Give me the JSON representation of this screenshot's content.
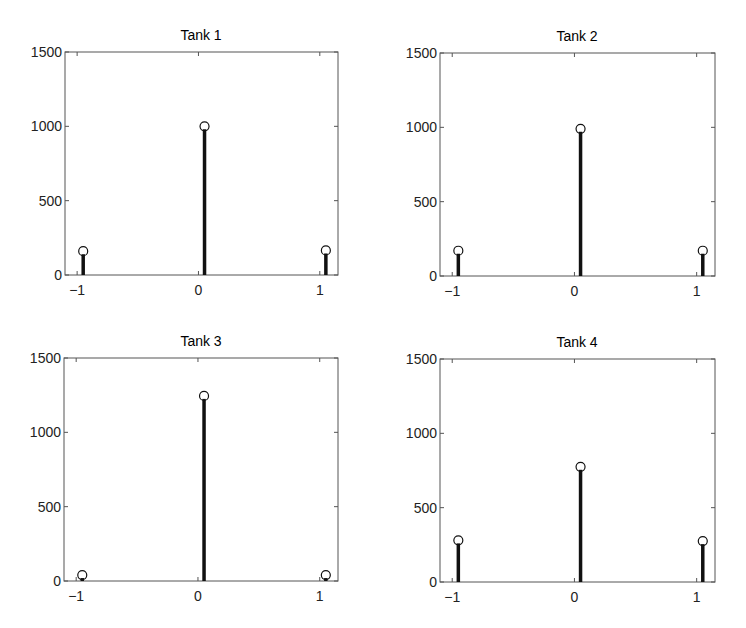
{
  "chart_data": [
    {
      "type": "stem",
      "title": "Tank 1",
      "x": [
        -0.95,
        0.05,
        1.05
      ],
      "values": [
        160,
        1000,
        165
      ],
      "xlim": [
        -1.1,
        1.15
      ],
      "ylim": [
        0,
        1500
      ],
      "xticks": [
        -1,
        0,
        1
      ],
      "xtick_labels": [
        "−1",
        "0",
        "1"
      ],
      "yticks": [
        0,
        500,
        1000,
        1500
      ],
      "ytick_labels": [
        "0",
        "500",
        "1000",
        "1500"
      ],
      "xlabel": "",
      "ylabel": "",
      "grid": false,
      "marker": "open-circle"
    },
    {
      "type": "stem",
      "title": "Tank 2",
      "x": [
        -0.95,
        0.05,
        1.05
      ],
      "values": [
        170,
        990,
        170
      ],
      "xlim": [
        -1.1,
        1.15
      ],
      "ylim": [
        0,
        1500
      ],
      "xticks": [
        -1,
        0,
        1
      ],
      "xtick_labels": [
        "−1",
        "0",
        "1"
      ],
      "yticks": [
        0,
        500,
        1000,
        1500
      ],
      "ytick_labels": [
        "0",
        "500",
        "1000",
        "1500"
      ],
      "xlabel": "",
      "ylabel": "",
      "grid": false,
      "marker": "open-circle"
    },
    {
      "type": "stem",
      "title": "Tank 3",
      "x": [
        -0.95,
        0.05,
        1.05
      ],
      "values": [
        40,
        1245,
        40
      ],
      "xlim": [
        -1.1,
        1.15
      ],
      "ylim": [
        0,
        1500
      ],
      "xticks": [
        -1,
        0,
        1
      ],
      "xtick_labels": [
        "−1",
        "0",
        "1"
      ],
      "yticks": [
        0,
        500,
        1000,
        1500
      ],
      "ytick_labels": [
        "0",
        "500",
        "1000",
        "1500"
      ],
      "xlabel": "",
      "ylabel": "",
      "grid": false,
      "marker": "open-circle"
    },
    {
      "type": "stem",
      "title": "Tank 4",
      "x": [
        -0.95,
        0.05,
        1.05
      ],
      "values": [
        280,
        775,
        275
      ],
      "xlim": [
        -1.1,
        1.15
      ],
      "ylim": [
        0,
        1500
      ],
      "xticks": [
        -1,
        0,
        1
      ],
      "xtick_labels": [
        "−1",
        "0",
        "1"
      ],
      "yticks": [
        0,
        500,
        1000,
        1500
      ],
      "ytick_labels": [
        "0",
        "500",
        "1000",
        "1500"
      ],
      "xlabel": "",
      "ylabel": "",
      "grid": false,
      "marker": "open-circle"
    }
  ],
  "style": {
    "axis_color": "#555555",
    "stem_color": "#111111",
    "text_color": "#222222"
  }
}
